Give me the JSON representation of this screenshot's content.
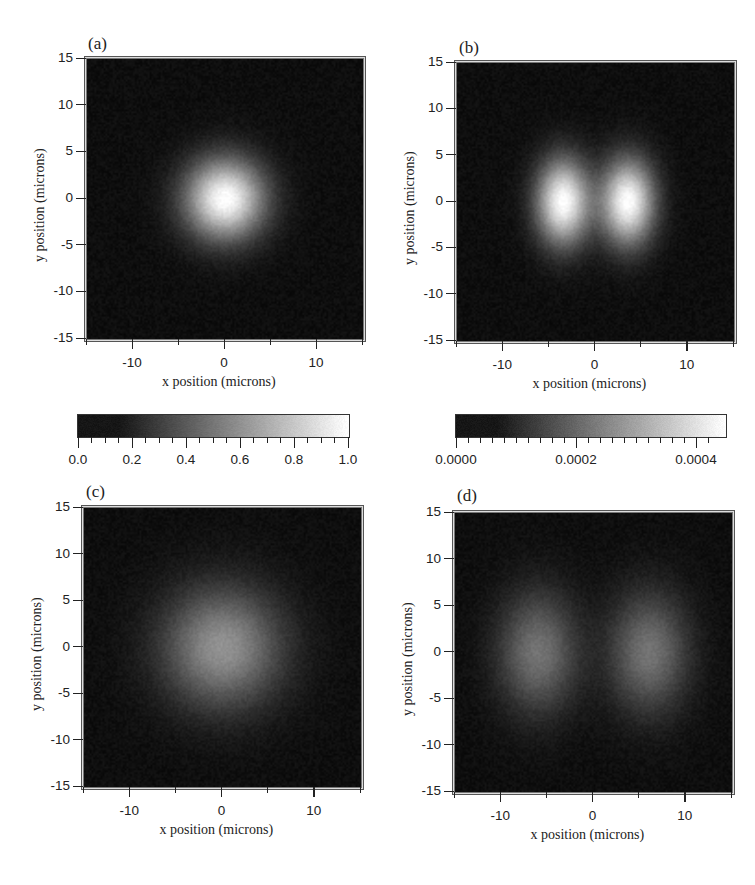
{
  "chart_data": [
    {
      "type": "heatmap",
      "panel": "(a)",
      "title": "",
      "xlabel": "x position (microns)",
      "ylabel": "y position (microns)",
      "xlim": [
        -15,
        15
      ],
      "ylim": [
        -15,
        15
      ],
      "xticks": [
        -10,
        0,
        10
      ],
      "yticks": [
        15,
        10,
        5,
        0,
        -5,
        -10,
        -15
      ],
      "colormap": "grayscale",
      "pattern": "single Gaussian spot centered at (0,0), 1/e radius ~4 microns",
      "features": [
        {
          "x": 0,
          "y": 0,
          "sigma_x": 3.0,
          "sigma_y": 3.0,
          "peak": 1.0
        }
      ],
      "colorbar": {
        "min": 0.0,
        "max": 1.0,
        "ticks": [
          "0.0",
          "0.2",
          "0.4",
          "0.6",
          "0.8",
          "1.0"
        ]
      }
    },
    {
      "type": "heatmap",
      "panel": "(b)",
      "title": "",
      "xlabel": "x position (microns)",
      "ylabel": "y position (microns)",
      "xlim": [
        -15,
        15
      ],
      "ylim": [
        -15,
        15
      ],
      "xticks": [
        -10,
        0,
        10
      ],
      "yticks": [
        15,
        10,
        5,
        0,
        -5,
        -10,
        -15
      ],
      "colormap": "grayscale",
      "pattern": "two-lobe (TEM10-like) distribution, lobes at x = ±3.5 microns, dark node at x = 0",
      "features": [
        {
          "x": -3.5,
          "y": 0,
          "sigma_x": 2.0,
          "sigma_y": 3.2,
          "peak": 0.00045
        },
        {
          "x": 3.5,
          "y": 0,
          "sigma_x": 2.0,
          "sigma_y": 3.2,
          "peak": 0.00045
        }
      ],
      "colorbar": {
        "min": 0.0,
        "max": 0.00045,
        "ticks": [
          "0.0000",
          "0.0002",
          "0.0004"
        ]
      }
    },
    {
      "type": "heatmap",
      "panel": "(c)",
      "title": "",
      "xlabel": "x position (microns)",
      "ylabel": "y position (microns)",
      "xlim": [
        -15,
        15
      ],
      "ylim": [
        -15,
        15
      ],
      "xticks": [
        -10,
        0,
        10
      ],
      "yticks": [
        15,
        10,
        5,
        0,
        -5,
        -10,
        -15
      ],
      "colormap": "grayscale",
      "pattern": "broadened single Gaussian spot centered at (0,0), dimmer, radius ~7 microns",
      "features": [
        {
          "x": 0,
          "y": 0,
          "sigma_x": 4.5,
          "sigma_y": 4.5,
          "peak": 0.55
        }
      ]
    },
    {
      "type": "heatmap",
      "panel": "(d)",
      "title": "",
      "xlabel": "x position (microns)",
      "ylabel": "y position (microns)",
      "xlim": [
        -15,
        15
      ],
      "ylim": [
        -15,
        15
      ],
      "xticks": [
        -10,
        0,
        10
      ],
      "yticks": [
        15,
        10,
        5,
        0,
        -5,
        -10,
        -15
      ],
      "colormap": "grayscale",
      "pattern": "broadened two-lobe distribution, lobes at x = ±6 microns, dark node at x = 0",
      "features": [
        {
          "x": -6,
          "y": 0,
          "sigma_x": 3.0,
          "sigma_y": 4.5,
          "peak": 0.42
        },
        {
          "x": 6,
          "y": 0,
          "sigma_x": 3.0,
          "sigma_y": 4.5,
          "peak": 0.42
        }
      ]
    }
  ],
  "panels": {
    "a": {
      "label": "(a)"
    },
    "b": {
      "label": "(b)"
    },
    "c": {
      "label": "(c)"
    },
    "d": {
      "label": "(d)"
    }
  },
  "axes": {
    "xlabel": "x position (microns)",
    "ylabel": "y position (microns)",
    "xticks": [
      "-10",
      "0",
      "10"
    ],
    "yticks": [
      "15",
      "10",
      "5",
      "0",
      "-5",
      "-10",
      "-15"
    ]
  },
  "colorbars": {
    "left": {
      "ticks": [
        "0.0",
        "0.2",
        "0.4",
        "0.6",
        "0.8",
        "1.0"
      ]
    },
    "right": {
      "ticks": [
        "0.0000",
        "0.0002",
        "0.0004"
      ]
    }
  }
}
